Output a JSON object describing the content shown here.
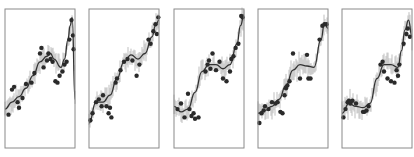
{
  "chart_data": [
    {
      "type": "scatter",
      "panel": 1,
      "title": "",
      "xlabel": "",
      "ylabel": "",
      "grid": false,
      "legend": null,
      "xlim": [
        0,
        1
      ],
      "ylim": [
        0,
        1
      ],
      "fit_line": {
        "x": [
          0,
          0.1,
          0.2,
          0.3,
          0.4,
          0.5,
          0.6,
          0.65,
          0.7,
          0.8,
          0.85,
          0.9,
          0.93,
          0.96,
          1.0
        ],
        "y": [
          0.28,
          0.33,
          0.37,
          0.43,
          0.52,
          0.62,
          0.66,
          0.68,
          0.64,
          0.58,
          0.64,
          0.78,
          0.88,
          0.94,
          0.35
        ]
      },
      "points": {
        "x": [
          0.05,
          0.1,
          0.13,
          0.18,
          0.2,
          0.25,
          0.3,
          0.38,
          0.42,
          0.5,
          0.52,
          0.55,
          0.6,
          0.62,
          0.65,
          0.68,
          0.72,
          0.75,
          0.78,
          0.82,
          0.85,
          0.88,
          0.92,
          0.95,
          0.97,
          0.98
        ],
        "y": [
          0.24,
          0.42,
          0.44,
          0.33,
          0.29,
          0.36,
          0.46,
          0.47,
          0.54,
          0.68,
          0.72,
          0.58,
          0.63,
          0.68,
          0.64,
          0.62,
          0.48,
          0.47,
          0.52,
          0.55,
          0.6,
          0.62,
          0.78,
          0.92,
          0.81,
          0.71
        ]
      }
    },
    {
      "type": "scatter",
      "panel": 2,
      "title": "",
      "xlabel": "",
      "ylabel": "",
      "grid": false,
      "legend": null,
      "xlim": [
        0,
        1
      ],
      "ylim": [
        0,
        1
      ],
      "fit_line": {
        "x": [
          0,
          0.1,
          0.2,
          0.3,
          0.4,
          0.5,
          0.6,
          0.7,
          0.8,
          0.9,
          0.95,
          1.0
        ],
        "y": [
          0.18,
          0.33,
          0.33,
          0.38,
          0.5,
          0.62,
          0.67,
          0.64,
          0.68,
          0.8,
          0.88,
          0.92
        ]
      },
      "points": {
        "x": [
          0.02,
          0.05,
          0.1,
          0.14,
          0.18,
          0.2,
          0.25,
          0.28,
          0.3,
          0.32,
          0.38,
          0.4,
          0.45,
          0.5,
          0.55,
          0.62,
          0.68,
          0.72,
          0.85,
          0.88,
          0.92,
          0.95,
          0.97,
          0.99
        ],
        "y": [
          0.2,
          0.25,
          0.33,
          0.35,
          0.3,
          0.38,
          0.3,
          0.25,
          0.29,
          0.22,
          0.47,
          0.5,
          0.56,
          0.62,
          0.64,
          0.63,
          0.52,
          0.6,
          0.78,
          0.75,
          0.84,
          0.89,
          0.82,
          0.94
        ]
      }
    },
    {
      "type": "scatter",
      "panel": 3,
      "title": "",
      "xlabel": "",
      "ylabel": "",
      "grid": false,
      "legend": null,
      "xlim": [
        0,
        1
      ],
      "ylim": [
        0,
        1
      ],
      "fit_line": {
        "x": [
          0,
          0.1,
          0.2,
          0.3,
          0.4,
          0.5,
          0.6,
          0.7,
          0.8,
          0.9,
          0.95,
          1.0
        ],
        "y": [
          0.3,
          0.26,
          0.28,
          0.4,
          0.55,
          0.6,
          0.6,
          0.57,
          0.6,
          0.75,
          0.88,
          0.96
        ]
      },
      "points": {
        "x": [
          0.05,
          0.1,
          0.15,
          0.2,
          0.22,
          0.25,
          0.28,
          0.3,
          0.35,
          0.45,
          0.48,
          0.5,
          0.52,
          0.55,
          0.6,
          0.65,
          0.7,
          0.75,
          0.8,
          0.82,
          0.85,
          0.88,
          0.92,
          0.96,
          0.98
        ],
        "y": [
          0.28,
          0.32,
          0.22,
          0.39,
          0.28,
          0.23,
          0.25,
          0.21,
          0.22,
          0.55,
          0.6,
          0.63,
          0.57,
          0.68,
          0.56,
          0.62,
          0.5,
          0.48,
          0.55,
          0.64,
          0.66,
          0.72,
          0.75,
          0.95,
          0.94
        ]
      }
    },
    {
      "type": "scatter",
      "panel": 4,
      "title": "",
      "xlabel": "",
      "ylabel": "",
      "grid": false,
      "legend": null,
      "xlim": [
        0,
        1
      ],
      "ylim": [
        0,
        1
      ],
      "fit_line": {
        "x": [
          0,
          0.1,
          0.2,
          0.3,
          0.4,
          0.5,
          0.6,
          0.7,
          0.8,
          0.9,
          0.95,
          1.0
        ],
        "y": [
          0.25,
          0.27,
          0.3,
          0.35,
          0.45,
          0.56,
          0.6,
          0.59,
          0.58,
          0.78,
          0.9,
          0.86
        ]
      },
      "points": {
        "x": [
          0.02,
          0.05,
          0.08,
          0.1,
          0.15,
          0.2,
          0.25,
          0.28,
          0.32,
          0.35,
          0.38,
          0.4,
          0.42,
          0.45,
          0.5,
          0.6,
          0.7,
          0.72,
          0.75,
          0.88,
          0.92,
          0.95,
          0.98
        ],
        "y": [
          0.18,
          0.25,
          0.27,
          0.3,
          0.28,
          0.33,
          0.32,
          0.33,
          0.26,
          0.25,
          0.38,
          0.43,
          0.45,
          0.48,
          0.68,
          0.5,
          0.67,
          0.5,
          0.5,
          0.78,
          0.88,
          0.89,
          0.89
        ]
      }
    },
    {
      "type": "scatter",
      "panel": 5,
      "title": "",
      "xlabel": "",
      "ylabel": "",
      "grid": false,
      "legend": null,
      "xlim": [
        0,
        1
      ],
      "ylim": [
        0,
        1
      ],
      "fit_line": {
        "x": [
          0,
          0.1,
          0.2,
          0.3,
          0.4,
          0.5,
          0.6,
          0.7,
          0.8,
          0.85,
          0.9,
          0.95,
          1.0
        ],
        "y": [
          0.25,
          0.32,
          0.3,
          0.29,
          0.32,
          0.5,
          0.6,
          0.6,
          0.58,
          0.7,
          0.85,
          0.92,
          0.8
        ]
      },
      "points": {
        "x": [
          0.02,
          0.05,
          0.08,
          0.1,
          0.12,
          0.15,
          0.2,
          0.3,
          0.32,
          0.35,
          0.38,
          0.55,
          0.58,
          0.6,
          0.65,
          0.7,
          0.75,
          0.78,
          0.8,
          0.82,
          0.88,
          0.92,
          0.94,
          0.97
        ],
        "y": [
          0.22,
          0.28,
          0.33,
          0.34,
          0.32,
          0.34,
          0.32,
          0.26,
          0.26,
          0.27,
          0.3,
          0.6,
          0.62,
          0.55,
          0.5,
          0.48,
          0.47,
          0.56,
          0.52,
          0.6,
          0.75,
          0.82,
          0.86,
          0.8
        ]
      }
    }
  ]
}
